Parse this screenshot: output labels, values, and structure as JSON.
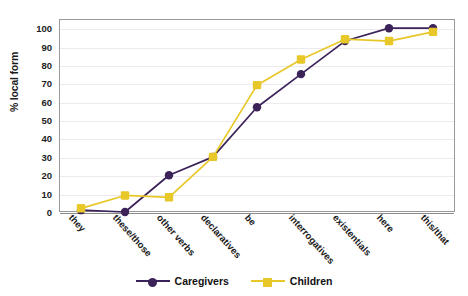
{
  "chart_data": {
    "type": "line",
    "title": "",
    "xlabel": "",
    "ylabel": "% local form",
    "ylim": [
      0,
      105
    ],
    "yticks": [
      0,
      10,
      20,
      30,
      40,
      50,
      60,
      70,
      80,
      90,
      100
    ],
    "grid": true,
    "legend_position": "bottom",
    "categories": [
      "they",
      "these/those",
      "other verbs",
      "declaratives",
      "be",
      "interrogatives",
      "existentials",
      "here",
      "this/that"
    ],
    "series": [
      {
        "name": "Caregivers",
        "color": "#3B2359",
        "marker": "circle",
        "values": [
          1,
          0,
          20,
          30,
          57,
          75,
          93,
          100,
          100
        ]
      },
      {
        "name": "Children",
        "color": "#E8C828",
        "marker": "square",
        "values": [
          2,
          9,
          8,
          30,
          69,
          83,
          94,
          93,
          98
        ]
      }
    ]
  },
  "legend": {
    "items": [
      {
        "label": "Caregivers",
        "color": "#3B2359",
        "marker": "circle"
      },
      {
        "label": "Children",
        "color": "#E8C828",
        "marker": "square"
      }
    ]
  }
}
